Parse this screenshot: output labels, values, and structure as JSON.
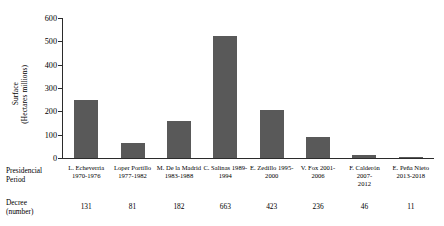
{
  "chart_data": {
    "type": "bar",
    "title": "",
    "xlabel": "Presidencial Period",
    "ylabel": "Surface (Hectares millions)",
    "ylim": [
      0,
      600
    ],
    "yticks": [
      0,
      100,
      200,
      300,
      400,
      500,
      600
    ],
    "grid": false,
    "legend": null,
    "bar_color": "#595959",
    "axis_color": "#2b2b2b",
    "categories": [
      "L. Echeverria 1970-1976",
      "Lopez Portillo 1977-1982",
      "M. De la Madrid 1983-1988",
      "C. Salinas 1989-1994",
      "E. Zedillo 1995-2000",
      "V. Fox 2001-2006",
      "F. Calderón 2007-2012",
      "E. Peña Nieto 2013-2018"
    ],
    "category_lines": [
      [
        "L. Echeverria",
        "1970-1976"
      ],
      [
        "Loper Portillo",
        "1977-1982"
      ],
      [
        "M. De la Madrid",
        "1983-1988"
      ],
      [
        "C. Salinas 1989-",
        "1994"
      ],
      [
        "E. Zedillo 1995-",
        "2000"
      ],
      [
        "V. Fox 2001-2006",
        ""
      ],
      [
        "F. Calderón 2007-",
        "2012"
      ],
      [
        "E. Peña Nieto",
        "2013-2018"
      ]
    ],
    "values": [
      250,
      65,
      160,
      525,
      205,
      92,
      15,
      5
    ],
    "decrees": [
      131,
      81,
      182,
      663,
      423,
      236,
      46,
      11
    ]
  },
  "labels": {
    "ylabel_line1": "Surface",
    "ylabel_line2": "(Hectares millions)",
    "row_period_line1": "Presidencial",
    "row_period_line2": "Period",
    "row_decree_line1": "Decree",
    "row_decree_line2": "(number)"
  }
}
